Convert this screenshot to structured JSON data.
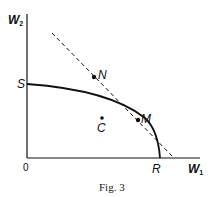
{
  "figure": {
    "caption": "Fig. 3",
    "axes": {
      "y_label": "W",
      "y_label_sub": "2",
      "x_label": "W",
      "x_label_sub": "1",
      "origin": "0"
    },
    "points": {
      "S": "S",
      "N": "N",
      "M": "M",
      "C": "C",
      "R": "R"
    },
    "elements": [
      {
        "type": "curve",
        "description": "concave frontier from S to R",
        "style": "solid"
      },
      {
        "type": "line",
        "description": "tangent line through N and M",
        "style": "dashed"
      }
    ],
    "colors": {
      "ink": "#111111",
      "background": "#ffffff"
    }
  }
}
